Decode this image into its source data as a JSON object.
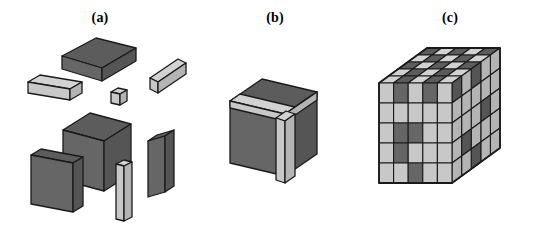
{
  "figure": {
    "background_color": "#ffffff",
    "width": 550,
    "height": 226
  },
  "colors": {
    "dark_face_front": "#666666",
    "dark_face_top": "#5c5c5c",
    "dark_face_side": "#555555",
    "light_face_front": "#c8c8c8",
    "light_face_top": "#d2d2d2",
    "light_face_side": "#b4b4b4",
    "outline": "#1a1a1a",
    "label_color": "#000000",
    "background": "#ffffff"
  },
  "panels": [
    {
      "id": "a",
      "label": "(a)",
      "caption_text": "(a)",
      "description": "Exploded view of the component blocks",
      "pieces": [
        {
          "name": "dark-flat-slab",
          "shade": "dark",
          "shape": "flat-slab"
        },
        {
          "name": "light-bar-left",
          "shade": "light",
          "shape": "bar"
        },
        {
          "name": "light-bar-right",
          "shade": "light",
          "shape": "bar"
        },
        {
          "name": "light-small-cube",
          "shade": "light",
          "shape": "cube"
        },
        {
          "name": "dark-large-cube",
          "shade": "dark",
          "shape": "cube"
        },
        {
          "name": "dark-plate-left",
          "shade": "dark",
          "shape": "plate"
        },
        {
          "name": "dark-plate-right",
          "shade": "dark",
          "shape": "plate"
        },
        {
          "name": "light-column",
          "shade": "light",
          "shape": "column"
        }
      ]
    },
    {
      "id": "b",
      "label": "(b)",
      "caption_text": "(b)",
      "description": "Assembled unit cube with light-coloured edge strips",
      "pieces": [
        {
          "name": "dark-body-cube",
          "shade": "dark",
          "shape": "cube"
        },
        {
          "name": "light-strip-top-front",
          "shade": "light",
          "shape": "strip"
        },
        {
          "name": "light-strip-top-right",
          "shade": "light",
          "shape": "strip"
        },
        {
          "name": "light-strip-vertical",
          "shade": "light",
          "shape": "strip"
        }
      ]
    },
    {
      "id": "c",
      "label": "(c)",
      "caption_text": "(c)",
      "description": "5 x 5 x 5 array of unit cubes forming the composite block",
      "array": {
        "nx": 5,
        "ny": 5,
        "nz": 5
      }
    }
  ],
  "chart_data": {
    "type": "diagram",
    "panel_labels": [
      "(a)",
      "(b)",
      "(c)"
    ],
    "grid": {
      "nx": 5,
      "ny": 5,
      "nz": 5
    },
    "front_face_pattern": [
      [
        0,
        1,
        0,
        1,
        0
      ],
      [
        0,
        0,
        0,
        0,
        0
      ],
      [
        0,
        1,
        1,
        0,
        0
      ],
      [
        0,
        1,
        0,
        0,
        0
      ],
      [
        0,
        0,
        1,
        0,
        0
      ]
    ],
    "top_face_pattern": [
      [
        1,
        0,
        1,
        0,
        1
      ],
      [
        0,
        1,
        0,
        1,
        0
      ],
      [
        1,
        0,
        1,
        0,
        1
      ],
      [
        0,
        1,
        0,
        1,
        0
      ],
      [
        0,
        1,
        0,
        1,
        0
      ]
    ],
    "right_face_pattern": [
      [
        0,
        0,
        1,
        0,
        1
      ],
      [
        0,
        0,
        0,
        0,
        0
      ],
      [
        0,
        1,
        0,
        0,
        0
      ],
      [
        0,
        0,
        0,
        1,
        0
      ],
      [
        0,
        0,
        1,
        0,
        0
      ]
    ],
    "legend": [
      {
        "code": 0,
        "name": "light-cell",
        "color": "#c8c8c8"
      },
      {
        "code": 1,
        "name": "dark-cell",
        "color": "#666666"
      }
    ]
  }
}
